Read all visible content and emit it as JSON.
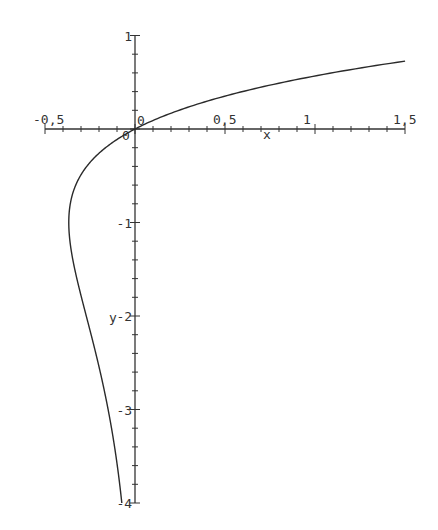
{
  "chart_data": {
    "type": "line",
    "title": "",
    "xlabel": "x",
    "ylabel": "y",
    "xlim": [
      -0.5,
      1.5
    ],
    "ylim": [
      -4,
      1
    ],
    "grid": false,
    "legend": null,
    "x_ticks": [
      "-0.5",
      "0",
      "0.5",
      "1",
      "1.5"
    ],
    "x_tick_labels": [
      "-0,5",
      "0",
      "0,5",
      "1",
      "1,5"
    ],
    "y_ticks": [
      "1",
      "0",
      "-1",
      "-2",
      "-3",
      "-4"
    ],
    "y_tick_labels": [
      "1",
      "0",
      "-1",
      "-2",
      "-3",
      "-4"
    ],
    "series": [
      {
        "name": "x = y·e^y",
        "description": "parametric curve, y from -4 to ~0.73",
        "points": [
          {
            "x": -0.073,
            "y": -4.0
          },
          {
            "x": -0.149,
            "y": -3.0
          },
          {
            "x": -0.271,
            "y": -2.0
          },
          {
            "x": -0.335,
            "y": -1.5
          },
          {
            "x": -0.368,
            "y": -1.0
          },
          {
            "x": -0.303,
            "y": -0.5
          },
          {
            "x": 0.0,
            "y": 0.0
          },
          {
            "x": 0.824,
            "y": 0.5
          },
          {
            "x": 1.5,
            "y": 0.726
          }
        ]
      }
    ]
  },
  "axes": {
    "x_label": "x",
    "y_label": "y",
    "x_origin_label": "0",
    "y_origin_label": "0"
  }
}
